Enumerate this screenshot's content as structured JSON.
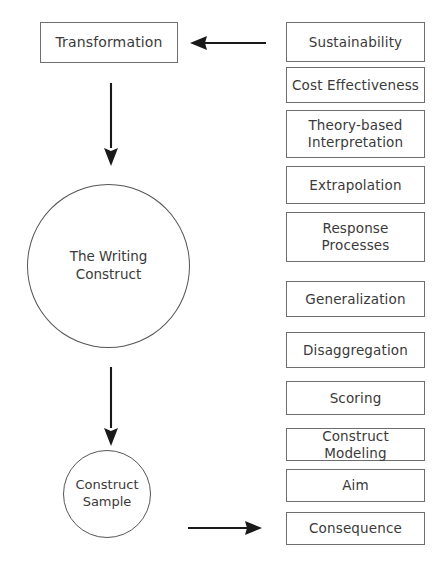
{
  "diagram": {
    "colors": {
      "box_border": "#6e6e6e",
      "circle_border": "#555555",
      "arrow": "#1a1a1a",
      "text": "#3a3a3a",
      "background": "#ffffff"
    },
    "left_flow": {
      "transformation": {
        "label": "Transformation",
        "shape": "rectangle"
      },
      "writing_construct": {
        "label": "The Writing\nConstruct",
        "shape": "circle"
      },
      "construct_sample": {
        "label": "Construct\nSample",
        "shape": "circle"
      }
    },
    "arrows": [
      {
        "name": "sustainability-to-transformation",
        "direction": "left",
        "from": "Sustainability",
        "to": "Transformation"
      },
      {
        "name": "transformation-to-writing-construct",
        "direction": "down",
        "from": "Transformation",
        "to": "The Writing Construct"
      },
      {
        "name": "writing-construct-to-construct-sample",
        "direction": "down",
        "from": "The Writing Construct",
        "to": "Construct Sample"
      },
      {
        "name": "construct-sample-to-consequence",
        "direction": "right",
        "from": "Construct Sample",
        "to": "Consequence"
      }
    ],
    "criteria_column": {
      "items": [
        {
          "label": "Sustainability",
          "top": 22,
          "height": 40
        },
        {
          "label": "Cost Effectiveness",
          "top": 67,
          "height": 36
        },
        {
          "label": "Theory-based\nInterpretation",
          "top": 110,
          "height": 48
        },
        {
          "label": "Extrapolation",
          "top": 166,
          "height": 38
        },
        {
          "label": "Response\nProcesses",
          "top": 212,
          "height": 50
        },
        {
          "label": "Generalization",
          "top": 281,
          "height": 36
        },
        {
          "label": "Disaggregation",
          "top": 332,
          "height": 36
        },
        {
          "label": "Scoring",
          "top": 381,
          "height": 34
        },
        {
          "label": "Construct Modeling",
          "top": 428,
          "height": 33
        },
        {
          "label": "Aim",
          "top": 469,
          "height": 33
        },
        {
          "label": "Consequence",
          "top": 512,
          "height": 33
        }
      ]
    }
  }
}
